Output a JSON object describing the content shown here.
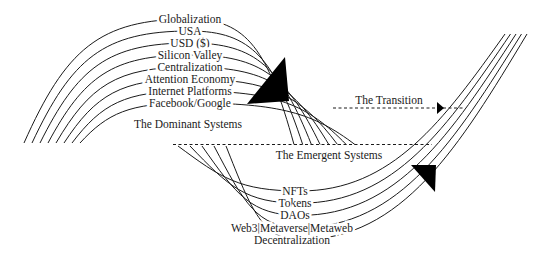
{
  "diagram": {
    "dominant": {
      "title": "The Dominant Systems",
      "layers": [
        "Globalization",
        "USA",
        "USD ($)",
        "Silicon Valley",
        "Centralization",
        "Attention Economy",
        "Internet Platforms",
        "Facebook/Google"
      ]
    },
    "transition": {
      "label": "The Transition"
    },
    "emergent": {
      "title": "The Emergent Systems",
      "layers": [
        "NFTs",
        "Tokens",
        "DAOs",
        "Web3|Metaverse|Metaweb",
        "Decentralization"
      ]
    },
    "colors": {
      "line": "#1a1a1a",
      "background": "#ffffff",
      "arrow": "#000000"
    }
  }
}
